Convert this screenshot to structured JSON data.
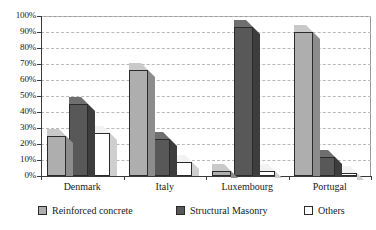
{
  "chart_data": {
    "type": "bar",
    "title": "",
    "subtitle": "",
    "xlabel": "",
    "ylabel": "",
    "ylim": [
      0,
      100
    ],
    "ytick_labels": [
      "0%",
      "10%",
      "20%",
      "30%",
      "40%",
      "50%",
      "60%",
      "70%",
      "80%",
      "90%",
      "100%"
    ],
    "ytick_values": [
      0,
      10,
      20,
      30,
      40,
      50,
      60,
      70,
      80,
      90,
      100
    ],
    "grid": true,
    "grid_axis": "y",
    "legend_position": "bottom",
    "value_unit": "%",
    "categories": [
      "Denmark",
      "Italy",
      "Luxembourg",
      "Portugal"
    ],
    "series": [
      {
        "name": "Reinforced concrete",
        "color": "#aeaeae",
        "values": [
          25,
          66,
          3,
          90
        ]
      },
      {
        "name": "Structural Masonry",
        "color": "#585858",
        "values": [
          45,
          23,
          93,
          12
        ]
      },
      {
        "name": "Others",
        "color": "#ffffff",
        "values": [
          27,
          9,
          3,
          2
        ]
      }
    ]
  },
  "legend": {
    "items": [
      {
        "label": "Reinforced concrete",
        "swatch": "#aeaeae"
      },
      {
        "label": "Structural Masonry",
        "swatch": "#585858"
      },
      {
        "label": "Others",
        "swatch": "#ffffff"
      }
    ]
  }
}
